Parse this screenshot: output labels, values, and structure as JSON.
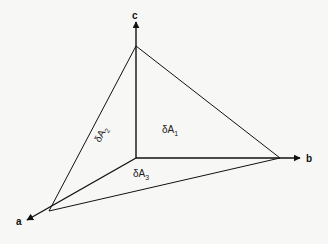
{
  "diagram": {
    "axes": [
      {
        "id": "a",
        "label": "a",
        "direction": "down-left"
      },
      {
        "id": "b",
        "label": "b",
        "direction": "right"
      },
      {
        "id": "c",
        "label": "c",
        "direction": "up"
      }
    ],
    "areas": [
      {
        "id": "dA1",
        "symbol": "δA",
        "subscript": "1",
        "face": "b-c plane"
      },
      {
        "id": "dA2",
        "symbol": "δA",
        "subscript": "2",
        "face": "a-c plane"
      },
      {
        "id": "dA3",
        "symbol": "δA",
        "subscript": "3",
        "face": "a-b plane"
      }
    ],
    "colors": {
      "line": "#111111",
      "background": "#f7f7f5"
    }
  }
}
